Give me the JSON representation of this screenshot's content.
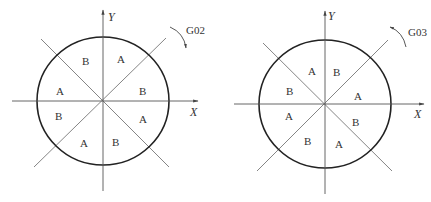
{
  "diagrams": [
    {
      "name": "G02 clockwise",
      "code": "G02",
      "x_axis_label": "X",
      "y_axis_label": "Y",
      "direction": "clockwise",
      "sectors": [
        {
          "label": "B",
          "x": 85,
          "y": 64
        },
        {
          "label": "A",
          "x": 121,
          "y": 62
        },
        {
          "label": "A",
          "x": 60,
          "y": 94
        },
        {
          "label": "B",
          "x": 143,
          "y": 94
        },
        {
          "label": "B",
          "x": 59,
          "y": 119
        },
        {
          "label": "A",
          "x": 143,
          "y": 122
        },
        {
          "label": "A",
          "x": 84,
          "y": 146
        },
        {
          "label": "B",
          "x": 116,
          "y": 145
        }
      ]
    },
    {
      "name": "G03 counterclockwise",
      "code": "G03",
      "x_axis_label": "X",
      "y_axis_label": "Y",
      "direction": "counterclockwise",
      "sectors": [
        {
          "label": "A",
          "x": 312,
          "y": 74
        },
        {
          "label": "B",
          "x": 337,
          "y": 75
        },
        {
          "label": "B",
          "x": 290,
          "y": 94
        },
        {
          "label": "A",
          "x": 358,
          "y": 99
        },
        {
          "label": "A",
          "x": 289,
          "y": 119
        },
        {
          "label": "B",
          "x": 356,
          "y": 125
        },
        {
          "label": "B",
          "x": 308,
          "y": 144
        },
        {
          "label": "A",
          "x": 339,
          "y": 147
        }
      ]
    }
  ]
}
